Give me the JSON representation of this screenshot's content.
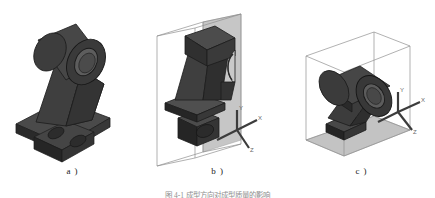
{
  "figure": {
    "caption": "图 4-1   成型方向对成型质量的影响",
    "background_color": "#ffffff",
    "solid_color": "#3a3a3a",
    "solid_light_color": "#5a5a5a",
    "solid_dark_color": "#242424",
    "wireframe_color": "#8c8c8c",
    "plane_color": "#b8b8b8",
    "axis_color": "#3c3c3c"
  },
  "panels": [
    {
      "id": "a",
      "label": "a )",
      "description": "bracket shown upright without bounding box or axes",
      "has_bounding_box": false,
      "has_axes": false,
      "has_shaded_plane": false
    },
    {
      "id": "b",
      "label": "b )",
      "description": "bracket standing vertically inside a tall wireframe bounding box with shaded back plane",
      "has_bounding_box": true,
      "has_axes": true,
      "has_shaded_plane": true,
      "axes": [
        {
          "name": "Y",
          "label": "Y"
        },
        {
          "name": "X",
          "label": "X"
        },
        {
          "name": "Z",
          "label": "Z"
        }
      ]
    },
    {
      "id": "c",
      "label": "c )",
      "description": "bracket lying on its back inside a wide wireframe bounding box with shaded ground plane",
      "has_bounding_box": true,
      "has_axes": true,
      "has_shaded_plane": true,
      "axes": [
        {
          "name": "Y",
          "label": "Y"
        },
        {
          "name": "X",
          "label": "X"
        },
        {
          "name": "Z",
          "label": "Z"
        }
      ]
    }
  ]
}
